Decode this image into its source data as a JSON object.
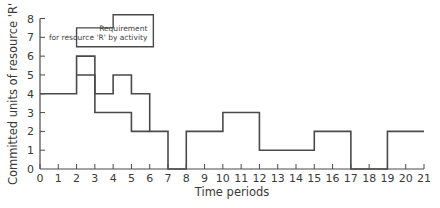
{
  "chart_data": {
    "type": "line",
    "subtype": "step",
    "title": "",
    "xlabel": "Time periods",
    "ylabel": "Committed units of resource 'R'",
    "xlim": [
      0,
      21
    ],
    "ylim": [
      0,
      8
    ],
    "x_ticks": [
      0,
      1,
      2,
      3,
      4,
      5,
      6,
      7,
      8,
      9,
      10,
      11,
      12,
      13,
      14,
      15,
      16,
      17,
      18,
      19,
      20,
      21
    ],
    "y_ticks": [
      0,
      1,
      2,
      3,
      4,
      5,
      6,
      7,
      8
    ],
    "grid": false,
    "legend": {
      "text_line1": "Requirement",
      "text_line2": "for resource 'R' by activity",
      "position": "top-left"
    },
    "series": [
      {
        "name": "Upper profile",
        "steps": [
          {
            "from": 0,
            "to": 2,
            "value": 4
          },
          {
            "from": 2,
            "to": 3,
            "value": 6
          },
          {
            "from": 3,
            "to": 4,
            "value": 4
          },
          {
            "from": 4,
            "to": 5,
            "value": 5
          },
          {
            "from": 5,
            "to": 6,
            "value": 4
          },
          {
            "from": 6,
            "to": 7,
            "value": 2
          },
          {
            "from": 7,
            "to": 8,
            "value": 0
          },
          {
            "from": 8,
            "to": 10,
            "value": 2
          },
          {
            "from": 10,
            "to": 12,
            "value": 3
          },
          {
            "from": 12,
            "to": 15,
            "value": 1
          },
          {
            "from": 15,
            "to": 17,
            "value": 2
          },
          {
            "from": 17,
            "to": 19,
            "value": 0
          },
          {
            "from": 19,
            "to": 21,
            "value": 2
          }
        ]
      },
      {
        "name": "Inner profile",
        "steps": [
          {
            "from": 2,
            "to": 3,
            "value": 5
          },
          {
            "from": 3,
            "to": 5,
            "value": 3
          },
          {
            "from": 5,
            "to": 6,
            "value": 2
          }
        ]
      }
    ]
  }
}
